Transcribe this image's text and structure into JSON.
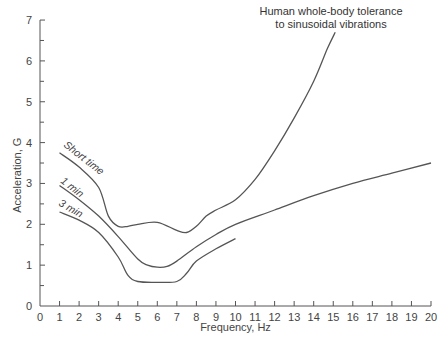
{
  "chart_data": {
    "type": "line",
    "title_lines": [
      "Human whole-body tolerance",
      "to sinusoidal vibrations"
    ],
    "xlabel": "Frequency, Hz",
    "ylabel": "Acceleration, G",
    "xlim": [
      0,
      20
    ],
    "ylim": [
      0,
      7
    ],
    "x_ticks": [
      0,
      1,
      2,
      3,
      4,
      5,
      6,
      7,
      8,
      9,
      10,
      11,
      12,
      13,
      14,
      15,
      16,
      17,
      18,
      19,
      20
    ],
    "y_ticks": [
      0,
      1,
      2,
      3,
      4,
      5,
      6,
      7
    ],
    "grid": false,
    "legend": "inline curve labels",
    "series": [
      {
        "name": "Short time",
        "points": [
          [
            1,
            3.75
          ],
          [
            2,
            3.4
          ],
          [
            3,
            2.9
          ],
          [
            3.5,
            2.2
          ],
          [
            4,
            1.95
          ],
          [
            4.5,
            1.95
          ],
          [
            5,
            2.0
          ],
          [
            6,
            2.05
          ],
          [
            7,
            1.85
          ],
          [
            7.5,
            1.8
          ],
          [
            8,
            1.95
          ],
          [
            8.5,
            2.2
          ],
          [
            9,
            2.35
          ],
          [
            10,
            2.6
          ],
          [
            11,
            3.1
          ],
          [
            12,
            3.8
          ],
          [
            13,
            4.6
          ],
          [
            14,
            5.5
          ],
          [
            14.7,
            6.3
          ],
          [
            15.1,
            6.7
          ]
        ]
      },
      {
        "name": "1 min",
        "points": [
          [
            1,
            2.95
          ],
          [
            2,
            2.6
          ],
          [
            3,
            2.2
          ],
          [
            4,
            1.7
          ],
          [
            5,
            1.15
          ],
          [
            5.5,
            1.0
          ],
          [
            6,
            0.95
          ],
          [
            6.5,
            0.97
          ],
          [
            7,
            1.1
          ],
          [
            8,
            1.45
          ],
          [
            9,
            1.75
          ],
          [
            10,
            2.0
          ],
          [
            12,
            2.35
          ],
          [
            14,
            2.7
          ],
          [
            16,
            3.0
          ],
          [
            18,
            3.25
          ],
          [
            20,
            3.5
          ]
        ]
      },
      {
        "name": "3 min",
        "points": [
          [
            1,
            2.3
          ],
          [
            2,
            2.1
          ],
          [
            3,
            1.8
          ],
          [
            4,
            1.2
          ],
          [
            4.5,
            0.75
          ],
          [
            5,
            0.6
          ],
          [
            6,
            0.58
          ],
          [
            7,
            0.6
          ],
          [
            7.5,
            0.8
          ],
          [
            8,
            1.1
          ],
          [
            9,
            1.4
          ],
          [
            10,
            1.65
          ]
        ]
      }
    ]
  }
}
